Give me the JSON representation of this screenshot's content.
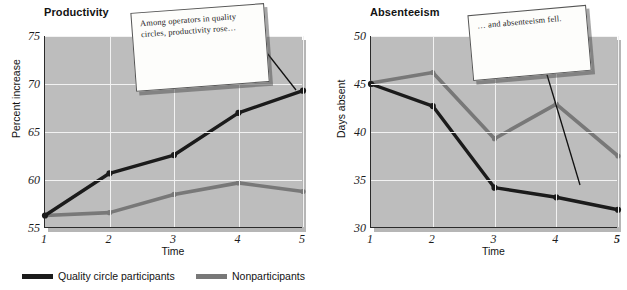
{
  "figure": {
    "series_colors": {
      "participants": "#1b1b1b",
      "nonparticipants": "#787878"
    },
    "plot_background": "#bdbdbd",
    "gridline_color": "#f2f2f2"
  },
  "legend": {
    "items": [
      {
        "label": "Quality circle participants",
        "color": "#1b1b1b",
        "icon": "line-swatch"
      },
      {
        "label": "Nonparticipants",
        "color": "#787878",
        "icon": "line-swatch"
      }
    ]
  },
  "callouts": [
    {
      "id": "productivity-note",
      "text": "Among operators in quality circles, productivity rose…"
    },
    {
      "id": "absenteeism-note",
      "text": "… and absenteeism fell."
    }
  ],
  "chart_data": [
    {
      "type": "line",
      "title": "Productivity",
      "xlabel": "Time",
      "ylabel": "Percent increase",
      "categories": [
        "1",
        "2",
        "3",
        "4",
        "5"
      ],
      "x": [
        1,
        2,
        3,
        4,
        5
      ],
      "xlim": [
        1,
        5
      ],
      "ylim": [
        55,
        75
      ],
      "yticks": [
        55,
        60,
        65,
        70,
        75
      ],
      "xticks": [
        "1",
        "2",
        "3",
        "4",
        "5"
      ],
      "grid": true,
      "legend_position": "bottom",
      "series": [
        {
          "name": "Quality circle participants",
          "color": "#1b1b1b",
          "values": [
            56.3,
            60.7,
            62.6,
            67.0,
            69.3
          ]
        },
        {
          "name": "Nonparticipants",
          "color": "#787878",
          "values": [
            56.3,
            56.6,
            58.5,
            59.7,
            58.8
          ]
        }
      ]
    },
    {
      "type": "line",
      "title": "Absenteeism",
      "xlabel": "Time",
      "ylabel": "Days absent",
      "categories": [
        "1",
        "2",
        "3",
        "4",
        "5"
      ],
      "x": [
        1,
        2,
        3,
        4,
        5
      ],
      "xlim": [
        1,
        5
      ],
      "ylim": [
        30,
        50
      ],
      "yticks": [
        30,
        35,
        40,
        45,
        50
      ],
      "xticks": [
        "1",
        "2",
        "3",
        "4",
        "5"
      ],
      "grid": true,
      "legend_position": "bottom",
      "series": [
        {
          "name": "Quality circle participants",
          "color": "#1b1b1b",
          "values": [
            45.0,
            42.7,
            34.2,
            33.2,
            31.9
          ]
        },
        {
          "name": "Nonparticipants",
          "color": "#787878",
          "values": [
            45.1,
            46.2,
            39.3,
            42.9,
            37.5
          ]
        }
      ]
    }
  ]
}
